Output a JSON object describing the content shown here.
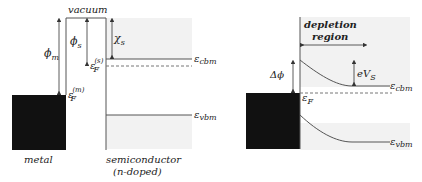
{
  "left_panel": {
    "vacuum_label": "vacuum",
    "phi_m": "ϕ",
    "phi_m_sub": "m",
    "phi_s": "ϕ",
    "phi_s_sub": "s",
    "chi_s": "χ",
    "chi_s_sub": "s",
    "ef_s": "ε",
    "ef_s_sub": "F",
    "ef_s_sup": "(s)",
    "ef_m": "ε",
    "ef_m_sub": "F",
    "ef_m_sup": "(m)",
    "cbm": "ε",
    "cbm_sub": "cbm",
    "vbm": "ε",
    "vbm_sub": "vbm",
    "metal_label": "metal",
    "semi_label_1": "semiconductor",
    "semi_label_2": "(n-doped)"
  },
  "right_panel": {
    "depletion_1": "depletion",
    "depletion_2": "region",
    "delta_phi": "Δϕ",
    "eVs": "eV",
    "eVs_sub": "S",
    "ef": "ε",
    "ef_sub": "F",
    "cbm": "ε",
    "cbm_sub": "cbm",
    "vbm": "ε",
    "vbm_sub": "vbm"
  },
  "colors": {
    "metal": "#111111",
    "semiconductor_fill": "#f2f2f2",
    "line": "#555555"
  }
}
